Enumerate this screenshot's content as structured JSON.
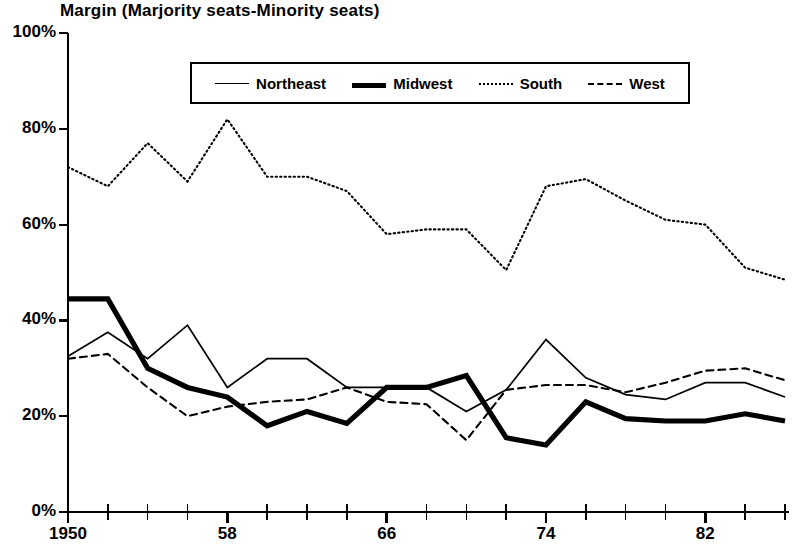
{
  "chart_data": {
    "type": "line",
    "title": "Margin (Marjority seats-Minority seats)",
    "xlabel": "",
    "ylabel": "",
    "ylim": [
      0,
      100
    ],
    "xlim": [
      1950,
      1986
    ],
    "grid": false,
    "legend_position": "top-center",
    "y_ticks": [
      "0%",
      "20%",
      "40%",
      "60%",
      "80%",
      "100%"
    ],
    "y_tick_values": [
      0,
      20,
      40,
      60,
      80,
      100
    ],
    "x_tick_values": [
      1950,
      1952,
      1954,
      1956,
      1958,
      1960,
      1962,
      1964,
      1966,
      1968,
      1970,
      1972,
      1974,
      1976,
      1978,
      1980,
      1982,
      1984,
      1986
    ],
    "x_tick_labels": [
      "1950",
      "",
      "",
      "",
      "58",
      "",
      "",
      "",
      "66",
      "",
      "",
      "",
      "74",
      "",
      "",
      "",
      "82",
      "",
      ""
    ],
    "x_labeled_ticks": [
      {
        "value": 1950,
        "label": "1950"
      },
      {
        "value": 1958,
        "label": "58"
      },
      {
        "value": 1966,
        "label": "66"
      },
      {
        "value": 1974,
        "label": "74"
      },
      {
        "value": 1982,
        "label": "82"
      }
    ],
    "x": [
      1950,
      1952,
      1954,
      1956,
      1958,
      1960,
      1962,
      1964,
      1966,
      1968,
      1970,
      1972,
      1974,
      1976,
      1978,
      1980,
      1982,
      1984,
      1986
    ],
    "series": [
      {
        "name": "Northeast",
        "style": "solid-thin",
        "color": "#000000",
        "values": [
          32.5,
          37.5,
          32.0,
          39.0,
          26.0,
          32.0,
          32.0,
          26.0,
          26.0,
          26.0,
          21.0,
          25.5,
          36.0,
          28.0,
          24.5,
          23.5,
          27.0,
          27.0,
          24.0
        ]
      },
      {
        "name": "Midwest",
        "style": "solid-thick",
        "color": "#000000",
        "values": [
          44.5,
          44.5,
          30.0,
          26.0,
          24.0,
          18.0,
          21.0,
          18.5,
          26.0,
          26.0,
          28.5,
          15.5,
          14.0,
          23.0,
          19.5,
          19.0,
          19.0,
          20.5,
          19.0
        ]
      },
      {
        "name": "South",
        "style": "dotted",
        "color": "#000000",
        "values": [
          72.0,
          68.0,
          77.0,
          69.0,
          82.0,
          70.0,
          70.0,
          67.0,
          58.0,
          59.0,
          59.0,
          50.5,
          68.0,
          69.5,
          65.0,
          61.0,
          60.0,
          51.0,
          48.5
        ]
      },
      {
        "name": "West",
        "style": "dashed",
        "color": "#000000",
        "values": [
          32.0,
          33.0,
          26.0,
          20.0,
          22.0,
          23.0,
          23.5,
          26.0,
          23.0,
          22.5,
          15.0,
          25.5,
          26.5,
          26.5,
          25.0,
          27.0,
          29.5,
          30.0,
          27.5
        ]
      }
    ]
  },
  "legend": {
    "items": [
      {
        "label": "Northeast",
        "style": "solid-thin"
      },
      {
        "label": "Midwest",
        "style": "solid-thick"
      },
      {
        "label": "South",
        "style": "dotted"
      },
      {
        "label": "West",
        "style": "dashed"
      }
    ]
  }
}
